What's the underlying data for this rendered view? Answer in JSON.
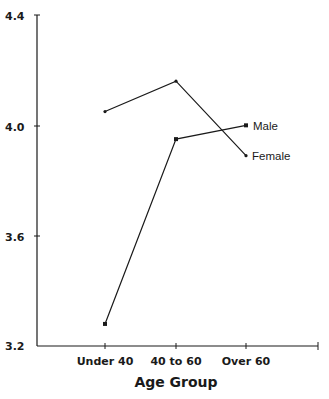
{
  "chart_data": {
    "type": "line",
    "title": "",
    "xlabel": "Age Group",
    "ylabel": "",
    "categories": [
      "Under 40",
      "40 to 60",
      "Over 60"
    ],
    "series": [
      {
        "name": "Male",
        "values": [
          3.28,
          3.95,
          4.0
        ],
        "marker": "square"
      },
      {
        "name": "Female",
        "values": [
          4.05,
          4.16,
          3.89
        ],
        "marker": "dot"
      }
    ],
    "ylim": [
      3.2,
      4.4
    ],
    "yticks": [
      "3.2",
      "3.6",
      "4.0",
      "4.4"
    ],
    "grid": false,
    "legend_position": "inline-right"
  },
  "colors": {
    "line": "#1a1a1a",
    "background": "#ffffff"
  }
}
